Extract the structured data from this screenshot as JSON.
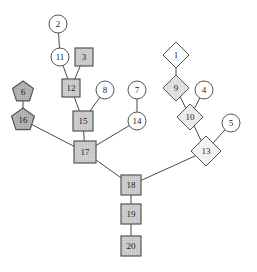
{
  "diagram": {
    "width": 257,
    "height": 272,
    "background": "#ffffff",
    "edge_color": "#4a4a4a",
    "label_color": "#1a1a1a",
    "palette": {
      "white": "#ffffff",
      "light_gray": "#e8e8e8",
      "mid_gray": "#cfcfcf",
      "dark_gray": "#b0b0b0",
      "stroke": "#555555"
    }
  },
  "nodes": [
    {
      "id": "1",
      "label": "1",
      "shape": "diamond",
      "fill": "#ffffff",
      "stroke": "#555555",
      "x": 176,
      "y": 55,
      "size": 13
    },
    {
      "id": "2",
      "label": "2",
      "shape": "circle",
      "fill": "#ffffff",
      "stroke": "#555555",
      "x": 58,
      "y": 24,
      "size": 9
    },
    {
      "id": "3",
      "label": "3",
      "shape": "square",
      "fill": "#cfcfcf",
      "stroke": "#555555",
      "x": 84,
      "y": 57,
      "size": 9
    },
    {
      "id": "4",
      "label": "4",
      "shape": "circle",
      "fill": "#ffffff",
      "stroke": "#555555",
      "x": 204,
      "y": 90,
      "size": 9
    },
    {
      "id": "5",
      "label": "5",
      "shape": "circle",
      "fill": "#ffffff",
      "stroke": "#555555",
      "x": 231,
      "y": 123,
      "size": 9
    },
    {
      "id": "6",
      "label": "6",
      "shape": "pentagon",
      "fill": "#b0b0b0",
      "stroke": "#555555",
      "x": 23,
      "y": 92,
      "size": 11
    },
    {
      "id": "7",
      "label": "7",
      "shape": "circle",
      "fill": "#ffffff",
      "stroke": "#555555",
      "x": 137,
      "y": 90,
      "size": 9
    },
    {
      "id": "8",
      "label": "8",
      "shape": "circle",
      "fill": "#ffffff",
      "stroke": "#555555",
      "x": 105,
      "y": 90,
      "size": 9
    },
    {
      "id": "9",
      "label": "9",
      "shape": "diamond",
      "fill": "#e0e0e0",
      "stroke": "#555555",
      "x": 176,
      "y": 88,
      "size": 13
    },
    {
      "id": "10",
      "label": "10",
      "shape": "diamond",
      "fill": "#eaeaea",
      "stroke": "#555555",
      "x": 190,
      "y": 117,
      "size": 13
    },
    {
      "id": "11",
      "label": "11",
      "shape": "circle",
      "fill": "#ffffff",
      "stroke": "#555555",
      "x": 60,
      "y": 57,
      "size": 9
    },
    {
      "id": "12",
      "label": "12",
      "shape": "square",
      "fill": "#cfcfcf",
      "stroke": "#555555",
      "x": 71,
      "y": 88,
      "size": 9
    },
    {
      "id": "13",
      "label": "13",
      "shape": "diamond",
      "fill": "#f2f2f2",
      "stroke": "#555555",
      "x": 206,
      "y": 151,
      "size": 15
    },
    {
      "id": "14",
      "label": "14",
      "shape": "circle",
      "fill": "#ffffff",
      "stroke": "#555555",
      "x": 137,
      "y": 121,
      "size": 9
    },
    {
      "id": "15",
      "label": "15",
      "shape": "square",
      "fill": "#cfcfcf",
      "stroke": "#555555",
      "x": 83,
      "y": 121,
      "size": 10
    },
    {
      "id": "16",
      "label": "16",
      "shape": "pentagon",
      "fill": "#b0b0b0",
      "stroke": "#555555",
      "x": 23,
      "y": 120,
      "size": 12
    },
    {
      "id": "17",
      "label": "17",
      "shape": "square",
      "fill": "#cfcfcf",
      "stroke": "#555555",
      "x": 85,
      "y": 152,
      "size": 11
    },
    {
      "id": "18",
      "label": "18",
      "shape": "square",
      "fill": "#cfcfcf",
      "stroke": "#555555",
      "x": 131,
      "y": 185,
      "size": 10
    },
    {
      "id": "19",
      "label": "19",
      "shape": "square",
      "fill": "#cfcfcf",
      "stroke": "#555555",
      "x": 131,
      "y": 214,
      "size": 10
    },
    {
      "id": "20",
      "label": "20",
      "shape": "square",
      "fill": "#cfcfcf",
      "stroke": "#555555",
      "x": 131,
      "y": 246,
      "size": 10
    }
  ],
  "edges": [
    {
      "from": "2",
      "to": "11"
    },
    {
      "from": "11",
      "to": "12"
    },
    {
      "from": "3",
      "to": "12"
    },
    {
      "from": "12",
      "to": "15"
    },
    {
      "from": "8",
      "to": "15"
    },
    {
      "from": "15",
      "to": "17"
    },
    {
      "from": "6",
      "to": "16"
    },
    {
      "from": "16",
      "to": "17"
    },
    {
      "from": "7",
      "to": "14"
    },
    {
      "from": "14",
      "to": "17"
    },
    {
      "from": "17",
      "to": "18"
    },
    {
      "from": "1",
      "to": "9"
    },
    {
      "from": "9",
      "to": "10"
    },
    {
      "from": "4",
      "to": "10"
    },
    {
      "from": "10",
      "to": "13"
    },
    {
      "from": "5",
      "to": "13"
    },
    {
      "from": "13",
      "to": "18"
    },
    {
      "from": "18",
      "to": "19"
    },
    {
      "from": "19",
      "to": "20"
    }
  ]
}
